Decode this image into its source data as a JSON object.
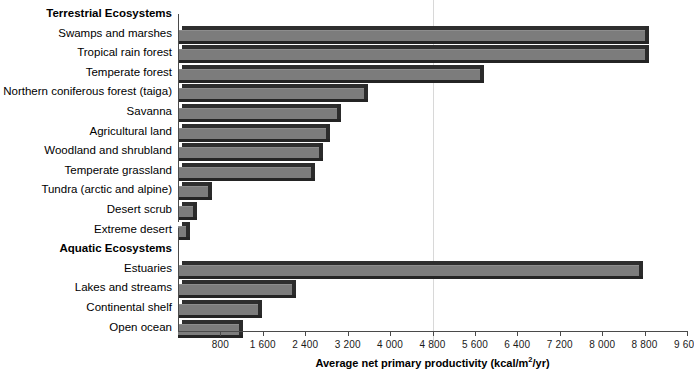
{
  "chart_data": {
    "type": "bar",
    "orientation": "horizontal",
    "title": "",
    "xlabel": "Average net primary productivity (kcal/m2/yr)",
    "xlabel_parts": {
      "before": "Average net primary productivity (kcal/m",
      "sup": "2",
      "after": "/yr)"
    },
    "ylabel": "",
    "xlim": [
      0,
      9600
    ],
    "xticks": [
      800,
      1600,
      2400,
      3200,
      4000,
      4800,
      5600,
      6400,
      7200,
      8000,
      8800,
      9600
    ],
    "xtick_labels": [
      "800",
      "1 600",
      "2 400",
      "3 200",
      "4 000",
      "4 800",
      "5 600",
      "6 400",
      "7 200",
      "8 000",
      "8 800",
      "9 600"
    ],
    "grid": false,
    "reference_lines": [
      4800
    ],
    "legend": null,
    "bar_color": "#7c7c7c",
    "bar_shadow_color": "#2b2b2b",
    "groups": [
      {
        "label": "Terrestrial Ecosystems",
        "categories": [
          "Swamps and marshes",
          "Tropical rain forest",
          "Temperate forest",
          "Northern coniferous forest (taiga)",
          "Savanna",
          "Agricultural land",
          "Woodland and shrubland",
          "Temperate grassland",
          "Tundra (arctic and alpine)",
          "Desert scrub",
          "Extreme desert"
        ],
        "values": [
          8800,
          8800,
          5700,
          3500,
          3000,
          2800,
          2650,
          2500,
          570,
          280,
          160
        ]
      },
      {
        "label": "Aquatic Ecosystems",
        "categories": [
          "Estuaries",
          "Lakes and streams",
          "Continental shelf",
          "Open ocean"
        ],
        "values": [
          8700,
          2150,
          1500,
          1150
        ]
      }
    ]
  }
}
